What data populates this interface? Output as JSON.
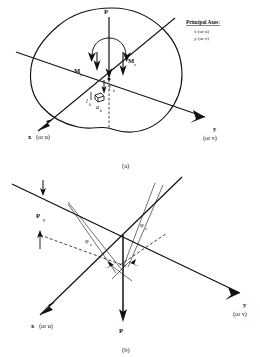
{
  "figure": {
    "legend": {
      "title": "Principal Axes:",
      "items": [
        "x (or u)",
        "y (or v)"
      ]
    },
    "panel_a": {
      "caption": "(a)",
      "labels": {
        "load": "P",
        "moment_y": "M",
        "moment_y_sub": "y",
        "moment_x": "M",
        "moment_x_sub": "x",
        "force_k": "f",
        "force_k_sub": "k",
        "area_k": "a",
        "area_k_sub": "k",
        "dist_k": "l",
        "dist_k_sub": "k",
        "axis_x": "x",
        "axis_x_alt": "(or u)",
        "axis_y": "y",
        "axis_y_alt": "(or v)"
      }
    },
    "panel_b": {
      "caption": "(b)",
      "labels": {
        "load_p": "P",
        "load_p_sub": "p",
        "load": "P",
        "phi_x": "φ",
        "phi_x_sub": "x",
        "phi_y": "φ",
        "phi_y_sub": "y",
        "axis_x": "x",
        "axis_x_alt": "(or u)",
        "axis_y": "y",
        "axis_y_alt": "(or v)"
      }
    },
    "colors": {
      "ink": "#111111",
      "background": "#ffffff"
    }
  }
}
